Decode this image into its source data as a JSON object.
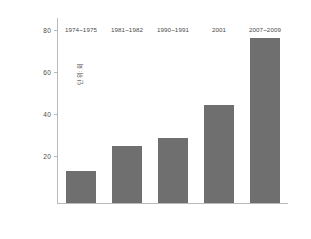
{
  "chart_data": {
    "type": "bar",
    "title": "",
    "subtitle": "",
    "xlabel": "",
    "ylabel": "단위: 회",
    "categories": [
      "1974~1975",
      "1981~1982",
      "1990~1991",
      "2001",
      "2007~2009"
    ],
    "values": [
      15,
      27,
      31,
      46.5,
      78.5
    ],
    "series": [
      {
        "name": "",
        "values": [
          15,
          27,
          31,
          46.5,
          78.5
        ]
      }
    ],
    "ylim": [
      0,
      88
    ],
    "yticks": [
      20,
      40,
      60,
      80
    ],
    "ytick_labels": [
      "20",
      "40",
      "60",
      "80"
    ],
    "grid": false,
    "legend": false,
    "legend_position": "none",
    "bar_color": "#6f6f6f",
    "axis_color": "#b9b9b9",
    "text_color": "#4a4a4a",
    "background": "#ffffff"
  }
}
